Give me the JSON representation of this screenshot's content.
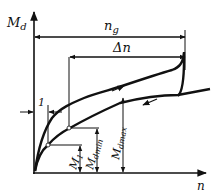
{
  "diagram": {
    "axes": {
      "y_label": "M",
      "y_label_sub": "d",
      "x_label": "n"
    },
    "dimensions": {
      "ng_label": "n",
      "ng_sub": "g",
      "dn_label": "Δn",
      "one_label": "1",
      "m1_label": "M",
      "m1_sub": "1",
      "mdmin_label": "M",
      "mdmin_sub": "dmin",
      "mdmax_label": "M",
      "mdmax_sub": "dmax"
    },
    "colors": {
      "ink": "#111111",
      "background": "#ffffff"
    }
  }
}
